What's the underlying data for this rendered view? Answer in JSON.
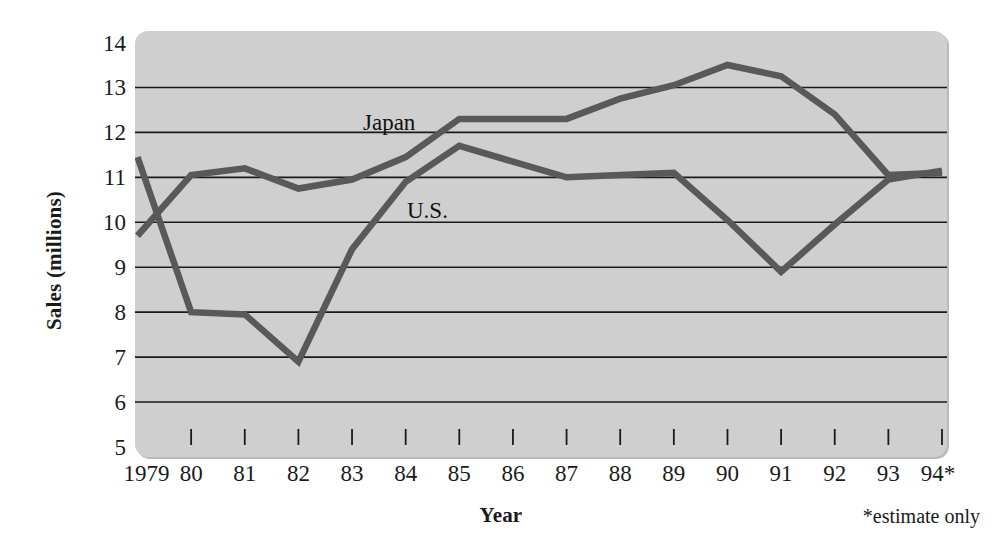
{
  "chart_data": {
    "type": "line",
    "title": "",
    "xlabel": "Year",
    "ylabel": "Sales (millions)",
    "categories": [
      "1979",
      "80",
      "81",
      "82",
      "83",
      "84",
      "85",
      "86",
      "87",
      "88",
      "89",
      "90",
      "91",
      "92",
      "93",
      "94*"
    ],
    "x": [
      1979,
      1980,
      1981,
      1982,
      1983,
      1984,
      1985,
      1986,
      1987,
      1988,
      1989,
      1990,
      1991,
      1992,
      1993,
      1994
    ],
    "xlim": [
      1979,
      1994
    ],
    "ylim": [
      5,
      14
    ],
    "yticks": [
      14,
      13,
      12,
      11,
      10,
      9,
      8,
      7,
      6,
      5
    ],
    "gridlines": [
      13,
      12,
      11,
      10,
      9,
      8,
      7,
      6
    ],
    "grid": true,
    "legend_position": "inline-annotation",
    "series": [
      {
        "name": "Japan",
        "color": "#595959",
        "values": [
          9.7,
          11.05,
          11.2,
          10.75,
          10.95,
          11.45,
          12.3,
          12.3,
          12.3,
          12.75,
          13.05,
          13.5,
          13.25,
          12.4,
          11.05,
          11.1
        ]
      },
      {
        "name": "U.S.",
        "color": "#595959",
        "values": [
          11.45,
          8.0,
          7.95,
          6.9,
          9.4,
          10.9,
          11.7,
          11.35,
          11.0,
          11.05,
          11.1,
          10.05,
          8.9,
          9.95,
          10.95,
          11.15
        ]
      }
    ],
    "annotations": [
      {
        "text": "Japan",
        "series": "Japan"
      },
      {
        "text": "U.S.",
        "series": "U.S."
      }
    ],
    "footnote": "*estimate only",
    "colors": {
      "plot_background": "#cfcfcf",
      "gridline": "#1a1a1a",
      "line": "#595959",
      "text": "#1a1a1a",
      "page_background": "#ffffff"
    }
  }
}
